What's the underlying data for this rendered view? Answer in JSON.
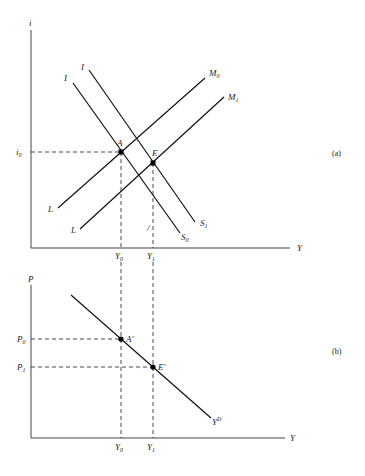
{
  "panel_a": {
    "tag": "(a)",
    "y_axis_label": "i",
    "x_axis_label": "Y",
    "tick_i0": {
      "main": "i",
      "sub": "0"
    },
    "tick_Y0": {
      "main": "Y",
      "sub": "0"
    },
    "tick_Y1": {
      "main": "Y",
      "sub": "1"
    },
    "curves": {
      "is_left": {
        "start_label": "I",
        "end_label": {
          "main": "S",
          "sub": "0"
        }
      },
      "is_right": {
        "start_label": "I",
        "end_label": {
          "main": "S",
          "sub": "1"
        }
      },
      "lm_upper": {
        "start_label": "L",
        "end_label": {
          "main": "M",
          "sub": "0"
        }
      },
      "lm_lower": {
        "start_label": "L",
        "end_label": {
          "main": "M",
          "sub": "1"
        }
      }
    },
    "points": {
      "A": {
        "label": "A"
      },
      "E": {
        "label": "E"
      }
    },
    "mark": "/"
  },
  "panel_b": {
    "tag": "(b)",
    "y_axis_label": "P",
    "x_axis_label": "Y",
    "tick_P0": {
      "main": "P",
      "sub": "0"
    },
    "tick_P1": {
      "main": "P",
      "sub": "1"
    },
    "tick_Y0": {
      "main": "Y",
      "sub": "0"
    },
    "tick_Y1": {
      "main": "Y",
      "sub": "1"
    },
    "curve": {
      "end_label": {
        "main": "Y",
        "sup": "D"
      }
    },
    "points": {
      "A_prime": {
        "label": "A′"
      },
      "E_prime": {
        "label": "E′"
      }
    }
  }
}
